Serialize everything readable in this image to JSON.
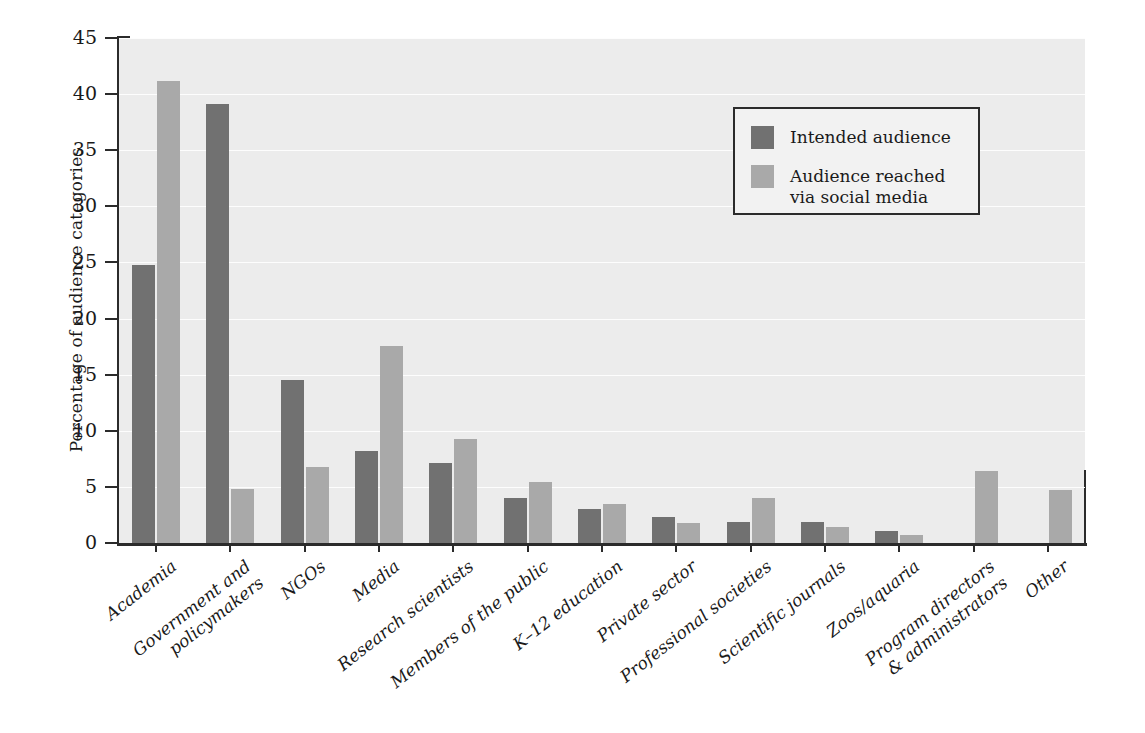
{
  "chart_data": {
    "type": "bar",
    "title": "",
    "subtitle": "",
    "xlabel": "",
    "ylabel": "Percentage of audience categories",
    "ylim": [
      0,
      45
    ],
    "yticks": [
      0,
      5,
      10,
      15,
      20,
      25,
      30,
      35,
      40,
      45
    ],
    "grid": "horizontal",
    "legend_position": "upper-right",
    "categories": [
      "Academia",
      "Government and\npolicymakers",
      "NGOs",
      "Media",
      "Research scientists",
      "Members of the public",
      "K–12 education",
      "Private sector",
      "Professional societies",
      "Scientific journals",
      "Zoos/aquaria",
      "Program directors\n& administrators",
      "Other"
    ],
    "series": [
      {
        "name": "Intended audience",
        "color": "#717171",
        "values": [
          24.8,
          39.1,
          14.5,
          8.2,
          7.1,
          4.0,
          3.0,
          2.3,
          1.9,
          1.9,
          1.1,
          0,
          0
        ]
      },
      {
        "name": "Audience reached\nvia social media",
        "color": "#a9a9a9",
        "values": [
          41.2,
          4.8,
          6.8,
          17.6,
          9.3,
          5.4,
          3.5,
          1.8,
          4.0,
          1.4,
          0.7,
          6.4,
          4.7
        ]
      }
    ]
  },
  "legend": {
    "entries": [
      {
        "label": "Intended audience"
      },
      {
        "label": "Audience reached\nvia social media"
      }
    ]
  },
  "colors": {
    "series_intended": "#717171",
    "series_reached": "#a9a9a9",
    "plot_background": "#ececec",
    "axis": "#2b2b2b",
    "gridline": "#fdfdfd"
  }
}
